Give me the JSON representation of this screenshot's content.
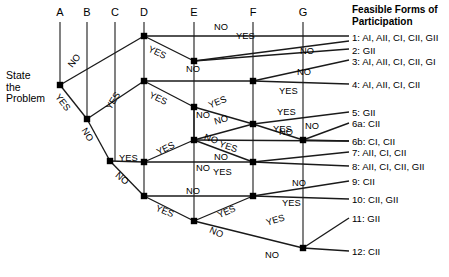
{
  "diagram": {
    "root_label": "State\nthe\nProblem",
    "root_label_lines": [
      "State",
      "the",
      "Problem"
    ],
    "legend_title": "Feasible Forms of Participation",
    "legend_title_lines": [
      "Feasible Forms of",
      "Participation"
    ],
    "columns": [
      {
        "id": "A",
        "label": "A",
        "x": 60
      },
      {
        "id": "B",
        "label": "B",
        "x": 87
      },
      {
        "id": "C",
        "label": "C",
        "x": 115
      },
      {
        "id": "D",
        "label": "D",
        "x": 144
      },
      {
        "id": "E",
        "label": "E",
        "x": 194
      },
      {
        "id": "F",
        "label": "F",
        "x": 253
      },
      {
        "id": "G",
        "label": "G",
        "x": 303
      }
    ],
    "outcomes": [
      {
        "id": "1",
        "label": "1: AI, AII, CI, CII, GII",
        "y": 38
      },
      {
        "id": "2",
        "label": "2: GII",
        "y": 51
      },
      {
        "id": "3",
        "label": "3: AI, AII, CI, CII, GI",
        "y": 62
      },
      {
        "id": "4",
        "label": "4: AI, AII, CI, CII",
        "y": 85
      },
      {
        "id": "5",
        "label": "5: GII",
        "y": 113
      },
      {
        "id": "6a",
        "label": "6a: CII",
        "y": 124
      },
      {
        "id": "6b",
        "label": "6b: CI, CII",
        "y": 142
      },
      {
        "id": "7",
        "label": "7: AII, CI, CII",
        "y": 153
      },
      {
        "id": "8",
        "label": "8: AII, CI, CII, GII",
        "y": 167
      },
      {
        "id": "9",
        "label": "9: CII",
        "y": 182
      },
      {
        "id": "10",
        "label": "10: CII, GII",
        "y": 200
      },
      {
        "id": "11",
        "label": "11: GII",
        "y": 219
      },
      {
        "id": "12",
        "label": "12: CII",
        "y": 252
      }
    ],
    "nodes": [
      {
        "id": "nA",
        "col": "A",
        "x": 60,
        "y": 85
      },
      {
        "id": "nB",
        "col": "B",
        "x": 87,
        "y": 119
      },
      {
        "id": "nC1",
        "col": "C",
        "x": 110,
        "y": 161
      },
      {
        "id": "nD1",
        "col": "D",
        "x": 144,
        "y": 36
      },
      {
        "id": "nD2",
        "col": "D",
        "x": 144,
        "y": 81
      },
      {
        "id": "nD3",
        "col": "D",
        "x": 144,
        "y": 162
      },
      {
        "id": "nD4",
        "col": "D",
        "x": 144,
        "y": 196
      },
      {
        "id": "nE1",
        "col": "E",
        "x": 194,
        "y": 61
      },
      {
        "id": "nE2",
        "col": "E",
        "x": 194,
        "y": 107
      },
      {
        "id": "nE3",
        "col": "E",
        "x": 194,
        "y": 140
      },
      {
        "id": "nE4",
        "col": "E",
        "x": 194,
        "y": 221
      },
      {
        "id": "nF1",
        "col": "F",
        "x": 253,
        "y": 81
      },
      {
        "id": "nF2",
        "col": "F",
        "x": 253,
        "y": 124
      },
      {
        "id": "nF3",
        "col": "F",
        "x": 253,
        "y": 162
      },
      {
        "id": "nF4",
        "col": "F",
        "x": 253,
        "y": 196
      },
      {
        "id": "nG1",
        "col": "G",
        "x": 303,
        "y": 140
      },
      {
        "id": "nG2",
        "col": "G",
        "x": 303,
        "y": 248
      }
    ],
    "verticals": [
      {
        "col": "A",
        "x": 60,
        "y1": 22,
        "y2": 85
      },
      {
        "col": "B",
        "x": 87,
        "y1": 22,
        "y2": 119
      },
      {
        "col": "C",
        "x": 115,
        "y1": 22,
        "y2": 161
      },
      {
        "col": "D",
        "x": 144,
        "y1": 22,
        "y2": 196
      },
      {
        "col": "E",
        "x": 194,
        "y1": 22,
        "y2": 221
      },
      {
        "col": "F",
        "x": 253,
        "y1": 22,
        "y2": 196
      },
      {
        "col": "G",
        "x": 303,
        "y1": 22,
        "y2": 248
      }
    ],
    "edges": [
      {
        "from": "nA",
        "to": "nD1",
        "branch": "NO",
        "lx": 66,
        "ly": 63,
        "rot": -52
      },
      {
        "from": "nA",
        "to": "nB",
        "branch": "YES",
        "lx": 61,
        "ly": 92,
        "rot": 52
      },
      {
        "from": "nB",
        "to": "nD2",
        "branch": "YES",
        "lx": 104,
        "ly": 106,
        "rot": -58
      },
      {
        "from": "nB",
        "to": "nC1",
        "branch": "NO",
        "lx": 88,
        "ly": 126,
        "rot": 58
      },
      {
        "from": "nD1",
        "to": "nE1",
        "branch": "YES",
        "lx": 151,
        "ly": 44,
        "rot": 25
      },
      {
        "from": "nD1",
        "to": "out1",
        "branch": "NO",
        "lx": 214,
        "ly": 22,
        "rot": 0
      },
      {
        "from": "nE1",
        "to": "out1",
        "branch": "YES",
        "lx": 236,
        "ly": 31,
        "rot": 0
      },
      {
        "from": "nE1",
        "to": "out2",
        "branch": "NO",
        "lx": 186,
        "ly": 64,
        "rot": 0
      },
      {
        "from": "nD2",
        "to": "nE2",
        "branch": "YES",
        "lx": 152,
        "ly": 90,
        "rot": 25
      },
      {
        "from": "nD2",
        "to": "nF1",
        "branch": "NO",
        "lx": 300,
        "ly": 46,
        "rot": 0
      },
      {
        "from": "nF1",
        "to": "out3",
        "branch": "NO",
        "lx": 297,
        "ly": 67,
        "rot": 0
      },
      {
        "from": "nF1",
        "to": "out4",
        "branch": "YES",
        "lx": 279,
        "ly": 86,
        "rot": 0
      },
      {
        "from": "nE2",
        "to": "nF2",
        "branch": "YES",
        "lx": 207,
        "ly": 101,
        "rot": -22
      },
      {
        "from": "nE2",
        "to": "nF2b",
        "branch": "NO",
        "lx": 196,
        "ly": 110,
        "rot": 0
      },
      {
        "from": "nF2",
        "to": "out5",
        "branch": "YES",
        "lx": 277,
        "ly": 107,
        "rot": 0
      },
      {
        "from": "nF2",
        "to": "nG1",
        "branch": "NO",
        "lx": 279,
        "ly": 127,
        "rot": 0
      },
      {
        "from": "nG1",
        "to": "out6a",
        "branch": "YES",
        "lx": 273,
        "ly": 124,
        "rot": 0
      },
      {
        "from": "nG1",
        "to": "out6b",
        "branch": "NO",
        "lx": 305,
        "ly": 121,
        "rot": 0
      },
      {
        "from": "nC1",
        "to": "nD3",
        "branch": "YES",
        "lx": 119,
        "ly": 153,
        "rot": 0
      },
      {
        "from": "nC1",
        "to": "nD4",
        "branch": "NO",
        "lx": 120,
        "ly": 170,
        "rot": 40
      },
      {
        "from": "nD3",
        "to": "nE3",
        "branch": "YES",
        "lx": 155,
        "ly": 148,
        "rot": -26
      },
      {
        "from": "nD3",
        "to": "nF3",
        "branch": "NO",
        "lx": 196,
        "ly": 163,
        "rot": 0
      },
      {
        "from": "nE3",
        "to": "nF3",
        "branch": "NO",
        "lx": 206,
        "ly": 132,
        "rot": 18
      },
      {
        "from": "nE3",
        "to": "nF2",
        "branch": "NO",
        "lx": 213,
        "ly": 117,
        "rot": -16
      },
      {
        "from": "nE3",
        "to": "nF3b",
        "branch": "YES",
        "lx": 221,
        "ly": 139,
        "rot": 18
      },
      {
        "from": "nF3",
        "to": "out7",
        "branch": "NO",
        "lx": 214,
        "ly": 152,
        "rot": 0
      },
      {
        "from": "nF3",
        "to": "out8",
        "branch": "YES",
        "lx": 213,
        "ly": 167,
        "rot": 0
      },
      {
        "from": "nD4",
        "to": "nE4",
        "branch": "YES",
        "lx": 158,
        "ly": 203,
        "rot": 22
      },
      {
        "from": "nD4",
        "to": "nF4",
        "branch": "NO",
        "lx": 186,
        "ly": 186,
        "rot": 0
      },
      {
        "from": "nF4",
        "to": "out9",
        "branch": "NO",
        "lx": 292,
        "ly": 178,
        "rot": 0
      },
      {
        "from": "nF4",
        "to": "out10",
        "branch": "YES",
        "lx": 282,
        "ly": 198,
        "rot": 0
      },
      {
        "from": "nE4",
        "to": "nF4",
        "branch": "YES",
        "lx": 216,
        "ly": 211,
        "rot": -24
      },
      {
        "from": "nE4",
        "to": "nG2",
        "branch": "NO",
        "lx": 212,
        "ly": 225,
        "rot": 24
      },
      {
        "from": "nG2",
        "to": "out11",
        "branch": "YES",
        "lx": 265,
        "ly": 218,
        "rot": -17
      },
      {
        "from": "nG2",
        "to": "out12",
        "branch": "NO",
        "lx": 265,
        "ly": 250,
        "rot": 0
      }
    ],
    "style": {
      "line_color": "#1a1a1a",
      "node_color": "#000000",
      "text_color": "#000000",
      "background": "#ffffff"
    }
  }
}
